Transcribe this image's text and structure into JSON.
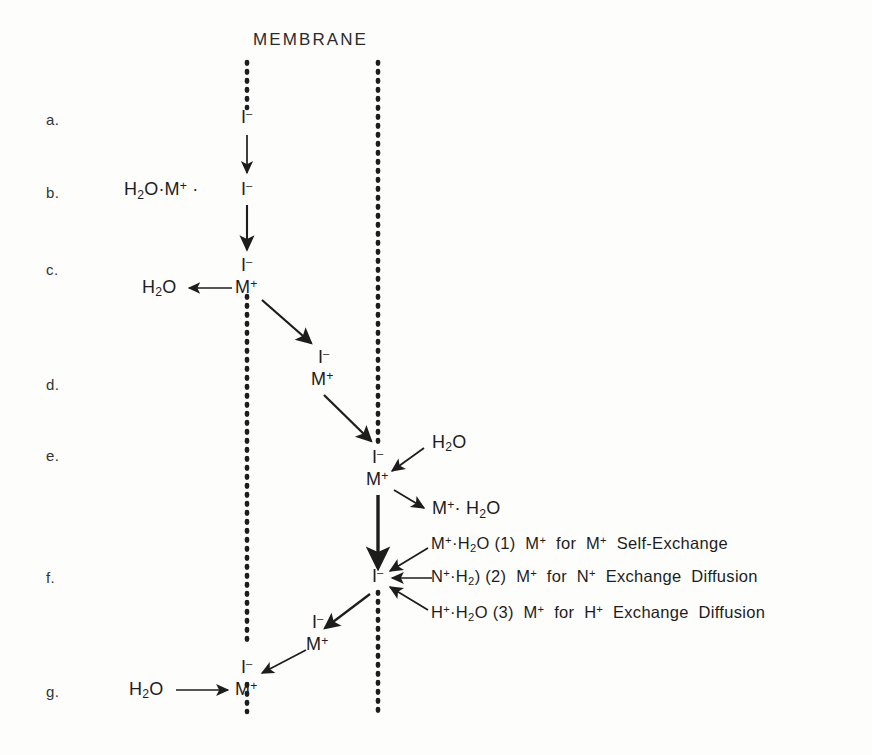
{
  "figure": {
    "title": "MEMBRANE",
    "background_color": "#fdfdfc",
    "ink_color": "#1d1d1d"
  },
  "row_labels": [
    {
      "key": "a."
    },
    {
      "key": "b."
    },
    {
      "key": "c."
    },
    {
      "key": "d."
    },
    {
      "key": "e."
    },
    {
      "key": "f."
    },
    {
      "key": "g."
    }
  ],
  "species": {
    "iodide": "I",
    "iodide_charge": "-",
    "metal": "M",
    "metal_charge": "+",
    "water": "H2O",
    "hydrated_metal_left": "H2O·M+ ·",
    "water_plain": "H2O",
    "metal_hydrate": "M+· H2O"
  },
  "labels": {
    "row_a_ion": "I",
    "row_b_ion": "I",
    "row_b_complex": "H",
    "row_c_ion_top": "I",
    "row_c_ion_bottom": "M",
    "row_c_water": "H",
    "row_d_ion_top": "I",
    "row_d_ion_bottom": "M",
    "row_e_ion_top": "I",
    "row_e_ion_bottom": "M",
    "row_e_water_in": "H",
    "row_e_metal_hydrate_out": "M",
    "row_f_ion": "I",
    "row_f_left_ion_top": "I",
    "row_f_left_ion_bottom": "M",
    "row_g_water": "H",
    "row_g_ion_top": "I",
    "row_g_ion_bottom": "M"
  },
  "mechanisms": [
    {
      "number": "(1)",
      "reactant": "M+·H2O",
      "description": "M+ for M+ Self-Exchange",
      "desc_prefix": "M",
      "desc_middle": "for",
      "desc_suffix": "Self-Exchange"
    },
    {
      "number": "(2)",
      "reactant": "N+·H2)",
      "description": "M+ for N+ Exchange Diffusion",
      "desc_prefix": "M",
      "desc_middle": "for",
      "desc_suffix": "Exchange  Diffusion"
    },
    {
      "number": "(3)",
      "reactant": "H+·H2O",
      "description": "M+ for H+ Exchange Diffusion",
      "desc_prefix": "M",
      "desc_middle": "for",
      "desc_suffix": "Exchange  Diffusion"
    }
  ],
  "membranes": [
    {
      "name": "left-membrane",
      "x": 247
    },
    {
      "name": "right-membrane",
      "x": 378
    }
  ]
}
